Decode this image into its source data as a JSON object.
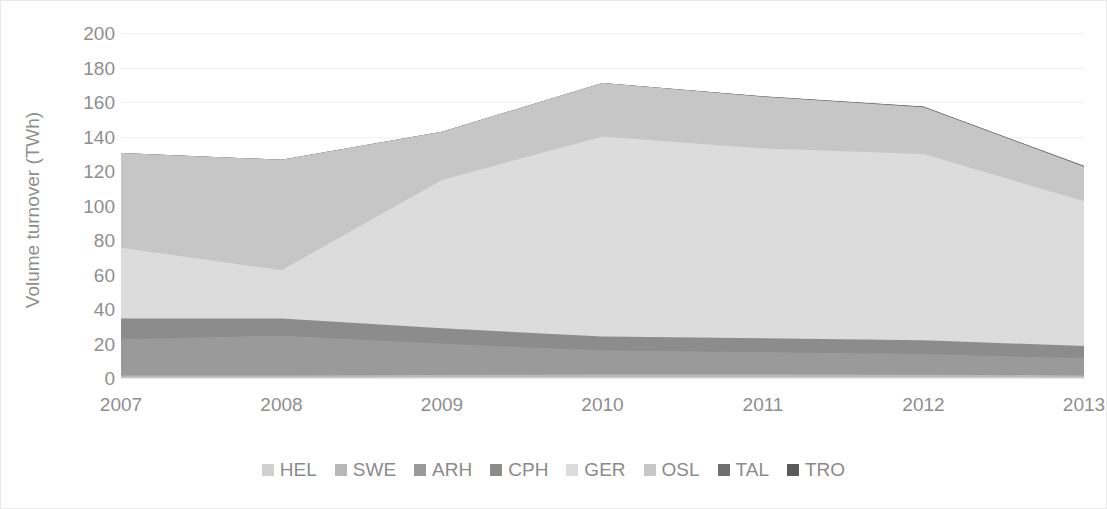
{
  "chart_data": {
    "type": "area",
    "stacked": true,
    "title": "",
    "subtitle": "",
    "xlabel": "",
    "ylabel": "Volume turnover (TWh)",
    "categories": [
      "2007",
      "2008",
      "2009",
      "2010",
      "2011",
      "2012",
      "2013"
    ],
    "x": [
      2007,
      2008,
      2009,
      2010,
      2011,
      2012,
      2013
    ],
    "ylim": [
      0,
      200
    ],
    "ytick_labels": [
      "0",
      "20",
      "40",
      "60",
      "80",
      "100",
      "120",
      "140",
      "160",
      "180",
      "200"
    ],
    "ytick_values": [
      0,
      20,
      40,
      60,
      80,
      100,
      120,
      140,
      160,
      180,
      200
    ],
    "xtick_labels": [
      "2007",
      "2008",
      "2009",
      "2010",
      "2011",
      "2012",
      "2013"
    ],
    "grid": true,
    "grid_axis": "y",
    "legend_position": "bottom",
    "legend_entries": [
      "HEL",
      "SWE",
      "ARH",
      "CPH",
      "GER",
      "OSL",
      "TAL",
      "TRO"
    ],
    "series": [
      {
        "name": "HEL",
        "color": "#d0d0d0",
        "values": [
          0.5,
          0.5,
          0.6,
          0.6,
          0.6,
          0.6,
          0.5
        ]
      },
      {
        "name": "SWE",
        "color": "#b8b8b8",
        "values": [
          1.0,
          1.0,
          1.2,
          1.4,
          1.4,
          1.3,
          1.0
        ]
      },
      {
        "name": "ARH",
        "color": "#9a9a9a",
        "values": [
          21.0,
          23.0,
          18.0,
          14.0,
          13.0,
          12.0,
          10.0
        ]
      },
      {
        "name": "CPH",
        "color": "#8c8c8c",
        "values": [
          12.0,
          10.0,
          9.0,
          8.0,
          8.0,
          8.0,
          7.0
        ]
      },
      {
        "name": "GER",
        "color": "#dcdcdc",
        "values": [
          41.0,
          28.0,
          86.0,
          116.0,
          110.0,
          108.0,
          84.0
        ]
      },
      {
        "name": "OSL",
        "color": "#c6c6c6",
        "values": [
          55.0,
          64.0,
          28.0,
          31.0,
          30.0,
          27.0,
          20.0
        ]
      },
      {
        "name": "TAL",
        "color": "#6f6f6f",
        "values": [
          0.0,
          0.0,
          0.0,
          0.0,
          0.2,
          0.3,
          0.3
        ]
      },
      {
        "name": "TRO",
        "color": "#5a5a5a",
        "values": [
          0.0,
          0.0,
          0.0,
          0.0,
          0.1,
          0.2,
          0.2
        ]
      }
    ],
    "stack_totals": [
      131,
      127,
      143,
      171,
      163,
      157,
      123
    ]
  },
  "colors": {
    "axis_text": "#8e8e8e",
    "gridline": "#f0f0f0",
    "frame": "#e9e9e9",
    "background": "#ffffff"
  }
}
